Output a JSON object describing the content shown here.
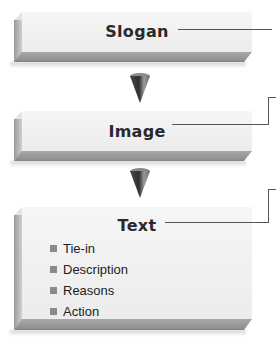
{
  "diagram": {
    "boxes": [
      {
        "id": "slogan",
        "title": "Slogan"
      },
      {
        "id": "image",
        "title": "Image"
      },
      {
        "id": "text",
        "title": "Text",
        "items": [
          "Tie-in",
          "Description",
          "Reasons",
          "Action"
        ]
      }
    ],
    "arrows": [
      {
        "from": "slogan",
        "to": "image",
        "icon": "cone-arrow-down-icon"
      },
      {
        "from": "image",
        "to": "text",
        "icon": "cone-arrow-down-icon"
      }
    ],
    "colors": {
      "box_face": "#f0f0f0",
      "box_bevel": "#999999",
      "connector": "#555555",
      "bullet": "#8a8a8a",
      "cone_dark": "#3a3a3a",
      "cone_light": "#bdbdbd"
    }
  }
}
